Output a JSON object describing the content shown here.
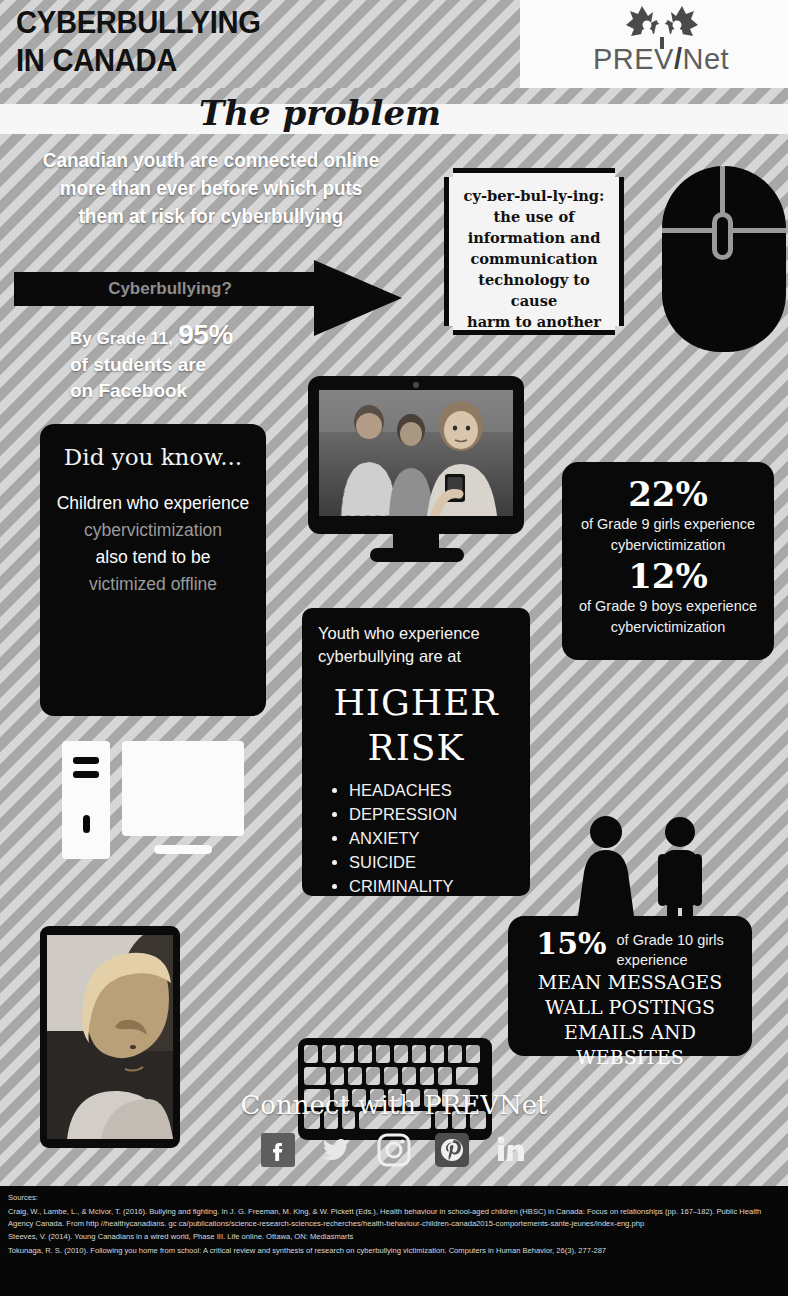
{
  "header": {
    "title_line1": "CYBERBULLYING",
    "title_line2": "IN CANADA",
    "logo_text_pre": "PREV",
    "logo_text_slash": "/",
    "logo_text_post": "Net",
    "logo_icon": "canada-maple-leaf-people-icon"
  },
  "problem": {
    "section_title": "The problem",
    "intro_line1": "Canadian youth are connected online",
    "intro_line2": "more than ever before which puts",
    "intro_line3": "them at risk for cyberbullying",
    "arrow_label": "Cyberbullying?"
  },
  "definition": {
    "line1": "cy-ber-bul-ly-ing:",
    "line2": "the use of",
    "line3": "information and",
    "line4": "communication",
    "line5": "technology to cause",
    "line6": "harm to another",
    "line7": "person"
  },
  "facebook_stat": {
    "prefix": "By Grade 11,",
    "value": "95%",
    "line2": "of students are",
    "line3": "on Facebook"
  },
  "did_you_know": {
    "title": "Did you know...",
    "line1": "Children who experience",
    "line2": "cybervictimization",
    "line3": "also tend to be",
    "line4": "victimized offline",
    "icon": "desktop-computer-icon"
  },
  "grade9_stats": [
    {
      "value": "22%",
      "caption_line1": "of Grade 9 girls experience",
      "caption_line2": "cybervictimization"
    },
    {
      "value": "12%",
      "caption_line1": "of Grade 9 boys experience",
      "caption_line2": "cybervictimization"
    }
  ],
  "higher_risk": {
    "intro_line1": "Youth who experience",
    "intro_line2": "cyberbullying are at",
    "headline_line1": "HIGHER",
    "headline_line2": "RISK",
    "items": [
      "HEADACHES",
      "DEPRESSION",
      "ANXIETY",
      "SUICIDE",
      "CRIMINALITY"
    ]
  },
  "grade10_stat": {
    "value": "15%",
    "caption_line1": "of Grade 10 girls",
    "caption_line2": "experience",
    "type_line1": "MEAN MESSAGES",
    "type_line2": "WALL POSTINGS",
    "type_line3": "EMAILS AND WEBSITES"
  },
  "images": {
    "monitor_photo_alt": "teens-with-phone-photo",
    "girl_photo_alt": "sad-girl-photo",
    "keyboard_alt": "keyboard-illustration",
    "mouse_alt": "computer-mouse-illustration",
    "people_alt": "female-and-male-silhouettes"
  },
  "connect": {
    "title": "Connect with PREVNet",
    "social": [
      {
        "name": "facebook-icon",
        "glyph": "f"
      },
      {
        "name": "twitter-icon",
        "glyph": "t"
      },
      {
        "name": "instagram-icon",
        "glyph": "i"
      },
      {
        "name": "pinterest-icon",
        "glyph": "p"
      },
      {
        "name": "linkedin-icon",
        "glyph": "in"
      }
    ]
  },
  "sources": {
    "label": "Sources:",
    "entries": [
      "Craig, W., Lambe, L., & McIvor, T. (2016). Bullying and fighting. In J. G. Freeman, M. King, & W. Pickett (Eds.), Health behaviour in school-aged children (HBSC) in Canada: Focus on relationships (pp. 167–182). Public Health Agency Canada. From http //healthycanadians. gc ca/publications/science-research-sciences-recherches/health-behaviour-children-canada2015-comportements-sante-jeunes/index-eng.php",
      "Steeves, V. (2014). Young Canadians in a wired world, Phase III. Life online. Ottawa, ON: Mediasmarts",
      "Tokunaga, R. S. (2010). Following you home from school: A critical review and synthesis of research on cyberbullying victimization. Computers in Human Behavior, 26(3), 277-287"
    ]
  },
  "colors": {
    "ink": "#090909",
    "paper": "#ffffff",
    "stripe_light": "#d6d6d6",
    "stripe_dark": "#a8a8a8",
    "muted_text": "#9a9a9a"
  }
}
